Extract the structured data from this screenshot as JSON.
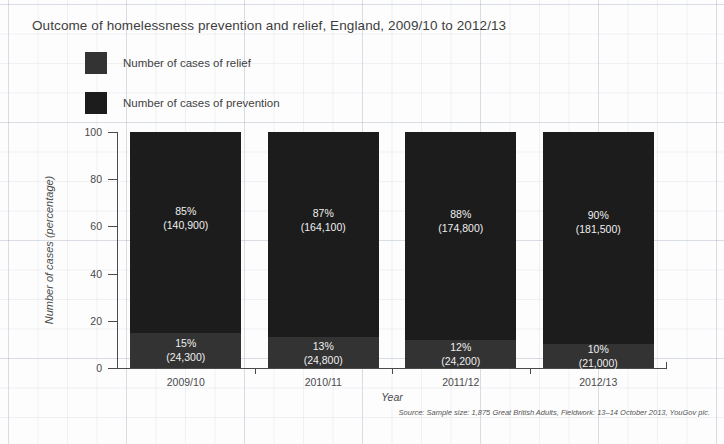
{
  "chart_data": {
    "type": "bar",
    "subtype": "stacked-percentage",
    "title": "Outcome of homelessness prevention and relief, England, 2009/10 to 2012/13",
    "xlabel": "Year",
    "ylabel": "Number of cases (percentage)",
    "ylim": [
      0,
      100
    ],
    "yticks": [
      0,
      20,
      40,
      60,
      80,
      100
    ],
    "ytick_labels": [
      "0",
      "20",
      "40",
      "60",
      "80",
      "100"
    ],
    "grid": false,
    "legend_position": "top-left",
    "categories": [
      "2009/10",
      "2010/11",
      "2011/12",
      "2012/13"
    ],
    "series": [
      {
        "name": "Number of cases of prevention",
        "color": "#1c1c1c",
        "values": [
          85,
          87,
          88,
          90
        ],
        "counts": [
          "140,900",
          "164,100",
          "174,800",
          "181,500"
        ],
        "labels": [
          "85%",
          "87%",
          "88%",
          "90%"
        ],
        "count_labels": [
          "(140,900)",
          "(164,100)",
          "(174,800)",
          "(181,500)"
        ]
      },
      {
        "name": "Number of cases of relief",
        "color": "#333333",
        "values": [
          15,
          13,
          12,
          10
        ],
        "counts": [
          "24,300",
          "24,800",
          "24,200",
          "21,000"
        ],
        "labels": [
          "15%",
          "13%",
          "12%",
          "10%"
        ],
        "count_labels": [
          "(24,300)",
          "(24,800)",
          "(24,200)",
          "(21,000)"
        ]
      }
    ],
    "source": "Source: Sample size: 1,875 Great British Adults, Fieldwork: 13–14 October 2013, YouGov plc."
  },
  "legend": {
    "items": [
      {
        "label": "Number of cases of relief",
        "color": "#333333"
      },
      {
        "label": "Number of cases of prevention",
        "color": "#1c1c1c"
      }
    ]
  }
}
